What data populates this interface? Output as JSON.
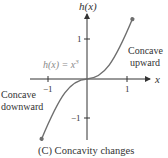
{
  "figure": {
    "axis_label_y": "h(x)",
    "axis_label_x": "x",
    "function_label": "h(x) = x",
    "function_exponent": "3",
    "tick_y_pos": "1",
    "tick_y_neg": "−1",
    "tick_x_neg": "−1",
    "tick_x_pos": "1",
    "annotation_upper_line1": "Concave",
    "annotation_upper_line2": "upward",
    "annotation_lower_line1": "Concave",
    "annotation_lower_line2": "downward",
    "caption": "(C)  Concavity changes",
    "curve_color": "#6e6e6e",
    "axis_color": "#333333"
  }
}
